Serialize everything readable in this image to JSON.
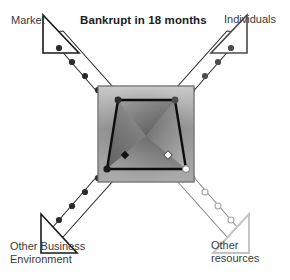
{
  "figure": {
    "title": "Bankrupt in 18 months",
    "type": "four-quadrant-arrow-diagram",
    "background_color": "#ffffff"
  },
  "labels": {
    "top_left": "Market",
    "top_right": "Individuals",
    "bottom_left": "Other Business\nEnvironment",
    "bottom_right": "Other\nresources"
  },
  "colors": {
    "arrow_dark_stroke": "#1a1a1a",
    "arrow_light_stroke": "#c9c9c9",
    "dot_dark": "#2b2b2b",
    "dot_mid": "#555555",
    "dot_light": "#bdbdbd",
    "square_border": "#6b6b6b",
    "square_fill_light": "#d8d8d8",
    "square_fill_dark": "#6e6e6e",
    "polygon_stroke": "#0d0d0d",
    "text_color": "#3a3a3a",
    "title_color": "#1a1a1a"
  },
  "axes": [
    {
      "name": "market-axis",
      "direction": "up-left",
      "label": "Market",
      "arrowhead": "filled-dark",
      "dot_count": 6,
      "dot_style": "solid-dark",
      "marker_position": 0.92
    },
    {
      "name": "individuals-axis",
      "direction": "up-right",
      "label": "Individuals",
      "arrowhead": "outline-dark",
      "dot_count": 6,
      "dot_style": "solid-mid",
      "marker_position": 0.9
    },
    {
      "name": "other-business-environment-axis",
      "direction": "down-left",
      "label": "Other Business Environment",
      "arrowhead": "filled-dark",
      "dot_count": 6,
      "dot_style": "solid-dark",
      "marker_position": 0.88
    },
    {
      "name": "other-resources-axis",
      "direction": "down-right",
      "label": "Other resources",
      "arrowhead": "outline-light",
      "dot_count": 6,
      "dot_style": "hollow-light",
      "marker_position": 0.9
    }
  ],
  "center_square": {
    "name": "gradient-square",
    "x": 98,
    "y": 86,
    "width": 96,
    "height": 96
  },
  "inner_polygon": {
    "name": "value-trapezoid",
    "points": "118,100 175,100 186,169 107,169"
  }
}
